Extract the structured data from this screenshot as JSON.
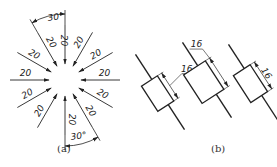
{
  "figure_a": {
    "caption": "(a)",
    "center": [
      65,
      80
    ],
    "dimension_value": "20",
    "angle_label_top": "30°",
    "angle_label_bottom": "30°",
    "radial_dimensions": [
      {
        "angle_deg": 90,
        "label": "20"
      },
      {
        "angle_deg": 120,
        "label": "20"
      },
      {
        "angle_deg": 150,
        "label": "20"
      },
      {
        "angle_deg": 180,
        "label": "20"
      },
      {
        "angle_deg": 210,
        "label": "20"
      },
      {
        "angle_deg": 240,
        "label": "20"
      },
      {
        "angle_deg": 270,
        "label": "20"
      },
      {
        "angle_deg": 300,
        "label": "20"
      },
      {
        "angle_deg": 330,
        "label": "20"
      },
      {
        "angle_deg": 0,
        "label": "20"
      },
      {
        "angle_deg": 30,
        "label": "20"
      },
      {
        "angle_deg": 60,
        "label": "20"
      }
    ]
  },
  "figure_b": {
    "caption": "(b)",
    "dimension_value": "16",
    "variants": [
      {
        "id": "b1",
        "label": "16",
        "placement": "leader-outside"
      },
      {
        "id": "b2",
        "label": "16",
        "placement": "leader-above"
      },
      {
        "id": "b3",
        "label": "16",
        "placement": "inline-along-dimension"
      }
    ]
  },
  "colors": {
    "line": "#222222",
    "background": "#ffffff"
  }
}
